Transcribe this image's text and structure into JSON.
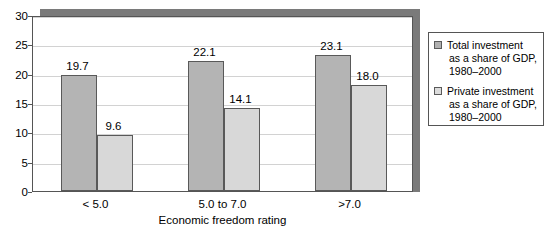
{
  "chart_data": {
    "type": "bar",
    "title": "",
    "xlabel": "Economic freedom rating",
    "ylabel": "",
    "categories": [
      "< 5.0",
      "5.0 to 7.0",
      ">7.0"
    ],
    "series": [
      {
        "name": "Total investment as a share of GDP, 1980–2000",
        "values": [
          19.7,
          22.1,
          23.1
        ],
        "value_labels": [
          "19.7",
          "22.1",
          "23.1"
        ],
        "color": "#b4b4b4"
      },
      {
        "name": "Private investment as a share of GDP, 1980–2000",
        "values": [
          9.6,
          14.1,
          18.0
        ],
        "value_labels": [
          "9.6",
          "14.1",
          "18.0"
        ],
        "color": "#d8d8d8"
      }
    ],
    "ylim": [
      0,
      30
    ],
    "yticks": [
      0,
      5,
      10,
      15,
      20,
      25,
      30
    ],
    "ytick_labels": [
      "0",
      "5",
      "10",
      "15",
      "20",
      "25",
      "30"
    ],
    "grid": true,
    "legend_position": "right"
  },
  "legend": {
    "entries": [
      {
        "swatch": "total",
        "lines": [
          "Total investment",
          "as a share of GDP,",
          "1980–2000"
        ]
      },
      {
        "swatch": "private",
        "lines": [
          "Private investment",
          "as a share of GDP,",
          "1980–2000"
        ]
      }
    ]
  },
  "colors": {
    "total_bar": "#b4b4b4",
    "private_bar": "#d8d8d8",
    "bar_border": "#595959",
    "gridline": "#d2d2d2",
    "frame": "#555555",
    "shadow": "#7a7a7a",
    "background": "#ffffff"
  }
}
